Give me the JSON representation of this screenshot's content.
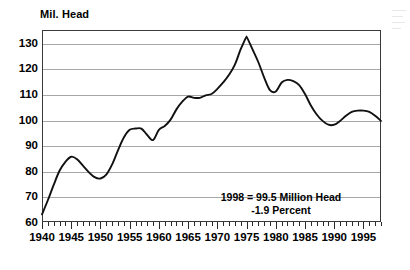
{
  "chart_data": {
    "type": "line",
    "title": "",
    "xlabel": "",
    "ylabel": "Mil. Head",
    "ylim": [
      60,
      135
    ],
    "xlim": [
      1940,
      1998
    ],
    "grid": true,
    "legend": "none",
    "yticks": [
      60,
      70,
      80,
      90,
      100,
      110,
      120,
      130
    ],
    "xticks": [
      1940,
      1945,
      1950,
      1955,
      1960,
      1965,
      1970,
      1975,
      1980,
      1985,
      1990,
      1995
    ],
    "minor_tick_interval": 1,
    "annotations": [
      "1998 = 99.5 Million Head",
      "-1.9 Percent"
    ],
    "series": [
      {
        "name": "Cattle inventory",
        "x": [
          1940,
          1941,
          1942,
          1943,
          1944,
          1945,
          1946,
          1947,
          1948,
          1949,
          1950,
          1951,
          1952,
          1953,
          1954,
          1955,
          1956,
          1957,
          1958,
          1959,
          1960,
          1961,
          1962,
          1963,
          1964,
          1965,
          1966,
          1967,
          1968,
          1969,
          1970,
          1971,
          1972,
          1973,
          1974,
          1975,
          1976,
          1977,
          1978,
          1979,
          1980,
          1981,
          1982,
          1983,
          1984,
          1985,
          1986,
          1987,
          1988,
          1989,
          1990,
          1991,
          1992,
          1993,
          1994,
          1995,
          1996,
          1997,
          1998
        ],
        "y": [
          63.0,
          68.5,
          74.5,
          80.0,
          83.5,
          85.5,
          84.5,
          82.0,
          79.5,
          77.5,
          77.0,
          78.5,
          82.5,
          88.0,
          93.0,
          96.0,
          96.5,
          96.5,
          94.0,
          92.0,
          96.0,
          97.5,
          100.0,
          104.0,
          107.0,
          109.0,
          108.5,
          108.5,
          109.5,
          110.0,
          112.0,
          114.5,
          117.5,
          121.5,
          127.5,
          132.5,
          127.5,
          122.5,
          116.5,
          111.5,
          111.0,
          114.5,
          115.5,
          115.0,
          113.5,
          110.0,
          105.5,
          102.0,
          99.5,
          98.0,
          98.0,
          99.5,
          101.5,
          103.0,
          103.5,
          103.5,
          103.0,
          101.5,
          99.5
        ]
      }
    ]
  }
}
